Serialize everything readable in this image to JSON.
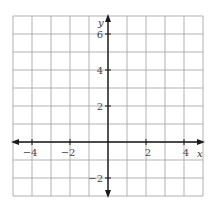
{
  "chart_data": {
    "type": "coordinate-grid",
    "title": "",
    "xlabel": "x",
    "ylabel": "y",
    "xlim": [
      -5,
      5
    ],
    "ylim": [
      -3,
      7
    ],
    "grid": true,
    "grid_step": 1,
    "x_tick_labels": [
      {
        "value": -4,
        "label": "−4"
      },
      {
        "value": -2,
        "label": "−2"
      },
      {
        "value": 2,
        "label": "2"
      },
      {
        "value": 4,
        "label": "4"
      }
    ],
    "y_tick_labels": [
      {
        "value": 6,
        "label": "6"
      },
      {
        "value": 4,
        "label": "4"
      },
      {
        "value": 2,
        "label": "2"
      },
      {
        "value": -2,
        "label": "−2"
      }
    ],
    "series": [],
    "legend": null
  },
  "colors": {
    "grid": "#a8a8a8",
    "axis": "#1a1a1a",
    "text": "#444444",
    "background": "#ffffff"
  }
}
